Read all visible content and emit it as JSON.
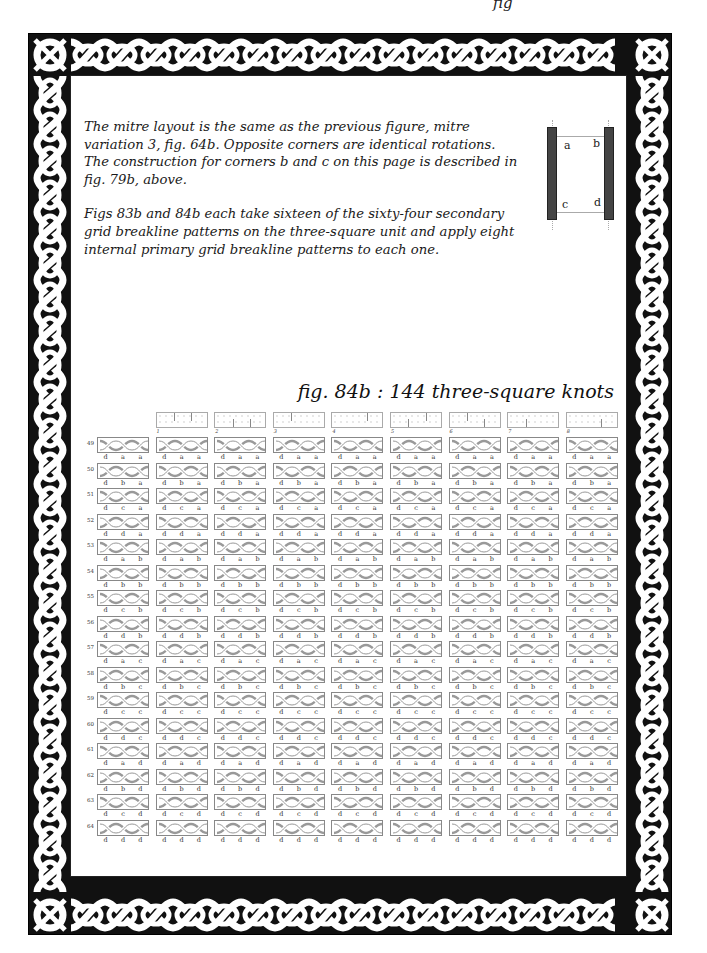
{
  "page": {
    "top_crop_text": "fig",
    "intro_paragraphs": [
      "The mitre layout is the same as the previous figure, mitre variation 3, fig. 64b. Opposite corners are identical rotations. The construction for corners b and c on this page is described in fig. 79b, above.",
      "Figs 83b and 84b each take sixteen of the sixty-four secondary grid breakline patterns on the three-square unit and apply eight internal primary grid breakline patterns to each one."
    ],
    "mitre_diagram": {
      "corner_labels": [
        "a",
        "b",
        "c",
        "d"
      ]
    },
    "figure_caption": "fig. 84b : 144 three-square knots"
  },
  "knot_table": {
    "column_headers": [
      "",
      "1",
      "2",
      "3",
      "4",
      "5",
      "6",
      "7",
      "8"
    ],
    "header_patterns": [
      null,
      {
        "top": [
          1,
          2
        ],
        "bottom": []
      },
      {
        "top": [],
        "bottom": [
          1,
          2
        ]
      },
      {
        "top": [
          1
        ],
        "bottom": []
      },
      {
        "top": [
          2
        ],
        "bottom": []
      },
      {
        "top": [
          2
        ],
        "bottom": [
          1
        ]
      },
      {
        "top": [
          1
        ],
        "bottom": [
          2
        ]
      },
      {
        "top": [],
        "bottom": [
          1
        ]
      },
      {
        "top": [],
        "bottom": [
          2
        ]
      }
    ],
    "rows": [
      {
        "label": "49",
        "letters": [
          "d",
          "a",
          "a"
        ]
      },
      {
        "label": "50",
        "letters": [
          "d",
          "b",
          "a"
        ]
      },
      {
        "label": "51",
        "letters": [
          "d",
          "c",
          "a"
        ]
      },
      {
        "label": "52",
        "letters": [
          "d",
          "d",
          "a"
        ]
      },
      {
        "label": "53",
        "letters": [
          "d",
          "a",
          "b"
        ]
      },
      {
        "label": "54",
        "letters": [
          "d",
          "b",
          "b"
        ]
      },
      {
        "label": "55",
        "letters": [
          "d",
          "c",
          "b"
        ]
      },
      {
        "label": "56",
        "letters": [
          "d",
          "d",
          "b"
        ]
      },
      {
        "label": "57",
        "letters": [
          "d",
          "a",
          "c"
        ]
      },
      {
        "label": "58",
        "letters": [
          "d",
          "b",
          "c"
        ]
      },
      {
        "label": "59",
        "letters": [
          "d",
          "c",
          "c"
        ]
      },
      {
        "label": "60",
        "letters": [
          "d",
          "d",
          "c"
        ]
      },
      {
        "label": "61",
        "letters": [
          "d",
          "a",
          "d"
        ]
      },
      {
        "label": "62",
        "letters": [
          "d",
          "b",
          "d"
        ]
      },
      {
        "label": "63",
        "letters": [
          "d",
          "c",
          "d"
        ]
      },
      {
        "label": "64",
        "letters": [
          "d",
          "d",
          "d"
        ]
      }
    ]
  },
  "colors": {
    "border_fill": "#111111",
    "strand": "#ffffff",
    "knot_line": "#888888",
    "mitre_bar": "#444444"
  }
}
